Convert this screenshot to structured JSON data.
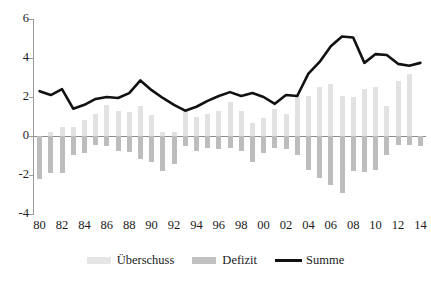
{
  "chart_data": {
    "type": "bar",
    "title": "",
    "subtitle": "",
    "xlabel": "",
    "ylabel": "",
    "ylim": [
      -4,
      6
    ],
    "yticks": [
      6,
      4,
      2,
      0,
      -2,
      -4
    ],
    "ytick_labels": [
      "6",
      "4",
      "2",
      "0",
      "-2",
      "-4"
    ],
    "grid": false,
    "legend_position": "bottom",
    "categories": [
      "80",
      "81",
      "82",
      "83",
      "84",
      "85",
      "86",
      "87",
      "88",
      "89",
      "90",
      "91",
      "92",
      "93",
      "94",
      "95",
      "96",
      "97",
      "98",
      "99",
      "00",
      "01",
      "02",
      "03",
      "04",
      "05",
      "06",
      "07",
      "08",
      "09",
      "10",
      "11",
      "12",
      "13",
      "14"
    ],
    "xtick_labels": [
      "80",
      "82",
      "84",
      "86",
      "88",
      "90",
      "92",
      "94",
      "96",
      "98",
      "00",
      "02",
      "04",
      "06",
      "08",
      "10",
      "12",
      "14"
    ],
    "series": [
      {
        "name": "Überschuss",
        "type": "bar",
        "color": "#e2e2e2",
        "values": [
          0.0,
          0.2,
          0.45,
          0.45,
          0.8,
          1.15,
          1.6,
          1.3,
          1.25,
          1.55,
          1.1,
          0.2,
          0.2,
          1.35,
          0.95,
          1.15,
          1.3,
          1.75,
          1.3,
          0.65,
          0.9,
          1.4,
          1.15,
          2.1,
          2.05,
          2.5,
          2.65,
          2.05,
          2.0,
          2.4,
          2.5,
          1.55,
          2.8,
          3.2,
          0.0
        ]
      },
      {
        "name": "Defizit",
        "type": "bar",
        "color": "#bdbdbd",
        "values": [
          -2.2,
          -1.9,
          -1.9,
          -0.95,
          -0.85,
          -0.45,
          -0.5,
          -0.75,
          -0.8,
          -1.2,
          -1.35,
          -1.8,
          -1.45,
          -0.5,
          -0.75,
          -0.6,
          -0.65,
          -0.6,
          -0.75,
          -1.35,
          -0.85,
          -0.6,
          -0.65,
          -0.95,
          -1.75,
          -2.15,
          -2.5,
          -2.9,
          -1.8,
          -1.85,
          -1.75,
          -0.95,
          -0.45,
          -0.45,
          -0.5
        ]
      },
      {
        "name": "Summe",
        "type": "line",
        "color": "#111111",
        "values": [
          2.3,
          2.1,
          2.4,
          1.4,
          1.6,
          1.9,
          2.0,
          1.95,
          2.2,
          2.85,
          2.35,
          1.95,
          1.6,
          1.3,
          1.5,
          1.8,
          2.05,
          2.25,
          2.05,
          2.2,
          2.0,
          1.65,
          2.1,
          2.05,
          3.2,
          3.8,
          4.6,
          5.1,
          5.05,
          3.75,
          4.2,
          4.15,
          3.7,
          3.6,
          3.75
        ]
      }
    ],
    "legend": [
      {
        "label": "Überschuss",
        "swatch": "bar-light",
        "color": "#e6e6e6"
      },
      {
        "label": "Defizit",
        "swatch": "bar-dark",
        "color": "#c2c2c2"
      },
      {
        "label": "Summe",
        "swatch": "line",
        "color": "#111111"
      }
    ]
  }
}
